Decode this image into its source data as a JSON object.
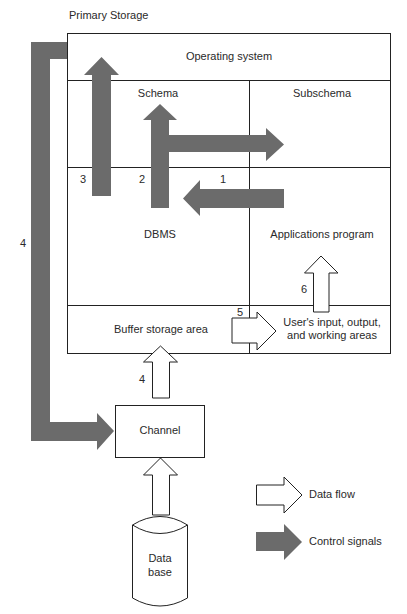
{
  "diagram": {
    "container_title": "Primary Storage",
    "regions": {
      "operating_system": "Operating system",
      "schema": "Schema",
      "subschema": "Subschema",
      "dbms": "DBMS",
      "applications_program": "Applications program",
      "buffer_storage": "Buffer storage area",
      "user_areas_line1": "User's input, output,",
      "user_areas_line2": "and working areas"
    },
    "external": {
      "channel": "Channel",
      "database_line1": "Data",
      "database_line2": "base"
    },
    "step_labels": {
      "step1": "1",
      "step2": "2",
      "step3": "3",
      "step4_control": "4",
      "step4_data": "4",
      "step5": "5",
      "step6": "6"
    },
    "legend": {
      "data_flow": "Data flow",
      "control_signals": "Control signals"
    },
    "colors": {
      "control_arrow": "#6b6b6b",
      "data_arrow_fill": "#ffffff",
      "line": "#222222"
    }
  }
}
